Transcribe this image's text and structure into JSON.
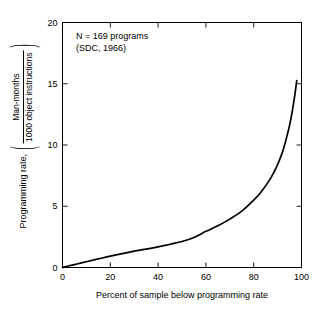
{
  "figure": {
    "background_color": "#ffffff",
    "line_color": "#000000",
    "axis_color": "#000000"
  },
  "annotation": {
    "line1": "N = 169 programs",
    "line2": "(SDC, 1966)"
  },
  "axes": {
    "x": {
      "title": "Percent of sample below programming rate",
      "ticks": [
        "0",
        "20",
        "40",
        "60",
        "80",
        "100"
      ],
      "tick_values": [
        0,
        20,
        40,
        60,
        80,
        100
      ],
      "min": 0,
      "max": 100
    },
    "y": {
      "title_prefix": "Programming rate,",
      "title_numerator": "Man-months",
      "title_denominator": "1000 object instructions",
      "paren_open": "(",
      "paren_close": ")",
      "ticks": [
        "0",
        "5",
        "10",
        "15",
        "20"
      ],
      "tick_values": [
        0,
        5,
        10,
        15,
        20
      ],
      "min": 0,
      "max": 20
    }
  },
  "chart_data": {
    "type": "line",
    "title": "",
    "subtitle": "",
    "xlabel": "Percent of sample below programming rate",
    "ylabel": "Programming rate, (Man-months / 1000 object instructions)",
    "xlim": [
      0,
      100
    ],
    "ylim": [
      0,
      20
    ],
    "xticks": [
      0,
      20,
      40,
      60,
      80,
      100
    ],
    "yticks": [
      0,
      5,
      10,
      15,
      20
    ],
    "grid": false,
    "legend": null,
    "annotations": [
      "N = 169 programs",
      "(SDC, 1966)"
    ],
    "series": [
      {
        "name": "Programming rate distribution",
        "color": "#000000",
        "line_width": 1.7,
        "x": [
          0,
          2,
          5,
          8,
          10,
          15,
          20,
          25,
          30,
          35,
          40,
          45,
          50,
          55,
          60,
          65,
          70,
          75,
          80,
          83,
          86,
          88,
          90,
          92,
          93,
          94,
          95,
          96,
          97,
          97.5,
          98
        ],
        "values": [
          0.0,
          0.1,
          0.24,
          0.38,
          0.47,
          0.7,
          0.93,
          1.13,
          1.33,
          1.5,
          1.68,
          1.9,
          2.12,
          2.45,
          2.95,
          3.4,
          3.95,
          4.6,
          5.5,
          6.15,
          6.95,
          7.6,
          8.4,
          9.4,
          10.05,
          10.8,
          11.6,
          12.6,
          13.8,
          14.5,
          15.25
        ]
      }
    ]
  }
}
